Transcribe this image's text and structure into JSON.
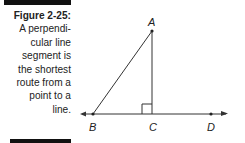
{
  "caption": {
    "title": "Figure 2-25:",
    "lines": [
      "A perpendi-",
      "cular line",
      "segment is",
      "the shortest",
      "route from a",
      "point to a",
      "line."
    ]
  },
  "diagram": {
    "points": {
      "A": {
        "label": "A",
        "x": 152,
        "y": 31
      },
      "B": {
        "label": "B",
        "x": 93,
        "y": 114
      },
      "C": {
        "label": "C",
        "x": 153,
        "y": 114
      },
      "D": {
        "label": "D",
        "x": 211,
        "y": 114
      }
    },
    "segments": [
      "AB",
      "AC"
    ],
    "line": "BD",
    "right_angle_at": "C"
  }
}
